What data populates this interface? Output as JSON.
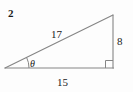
{
  "figure": {
    "number_label": "2",
    "type": "right-triangle-diagram",
    "stroke_color": "#858585",
    "text_color": "#1a1a1a",
    "background_color": "#fdfdfd",
    "width": 133,
    "height": 92
  },
  "triangle": {
    "vertices": {
      "left_angle_vertex": [
        5,
        68
      ],
      "right_angle_vertex": [
        113,
        68
      ],
      "apex_vertex": [
        113,
        15
      ]
    },
    "sides": [
      {
        "name": "hypotenuse",
        "label": "17",
        "from": "left_angle_vertex",
        "to": "apex_vertex"
      },
      {
        "name": "opposite-leg",
        "label": "8",
        "from": "right_angle_vertex",
        "to": "apex_vertex"
      },
      {
        "name": "adjacent-leg",
        "label": "15",
        "from": "left_angle_vertex",
        "to": "right_angle_vertex"
      }
    ],
    "angles": [
      {
        "name": "theta",
        "label": "θ",
        "at": "left_angle_vertex",
        "marker": "arc"
      },
      {
        "name": "right-angle",
        "label": "",
        "at": "right_angle_vertex",
        "marker": "square"
      }
    ]
  }
}
